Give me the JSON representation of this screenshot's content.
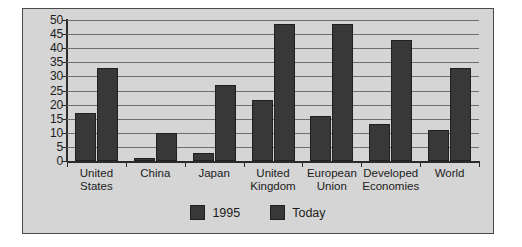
{
  "chart_data": {
    "type": "bar",
    "title": "",
    "xlabel": "",
    "ylabel": "",
    "ylim": [
      0,
      50
    ],
    "yticks": [
      0,
      5,
      10,
      15,
      20,
      25,
      30,
      35,
      40,
      45,
      50
    ],
    "grid": true,
    "legend_position": "bottom-center",
    "categories": [
      "United States",
      "China",
      "Japan",
      "United Kingdom",
      "European Union",
      "Developed Economies",
      "World"
    ],
    "category_lines": [
      [
        "United",
        "States"
      ],
      [
        "China"
      ],
      [
        "Japan"
      ],
      [
        "United",
        "Kingdom"
      ],
      [
        "European",
        "Union"
      ],
      [
        "Developed",
        "Economies"
      ],
      [
        "World"
      ]
    ],
    "series": [
      {
        "name": "1995",
        "color": "#383838",
        "values": [
          17,
          1,
          3,
          21.5,
          16,
          13,
          11
        ]
      },
      {
        "name": "Today",
        "color": "#383838",
        "values": [
          33,
          10,
          27,
          48.5,
          48.5,
          43,
          33
        ]
      }
    ]
  },
  "legend": {
    "items": [
      {
        "label": "1995",
        "color": "#383838"
      },
      {
        "label": "Today",
        "color": "#383838"
      }
    ]
  },
  "style": {
    "plot_background": "#d5d5d5",
    "frame_border": "#4a4a4a",
    "gridline_color": "#6f6f6f",
    "axis_color": "#2b2b2b",
    "text_color": "#1c1c1c",
    "page_background": "#ffffff"
  }
}
